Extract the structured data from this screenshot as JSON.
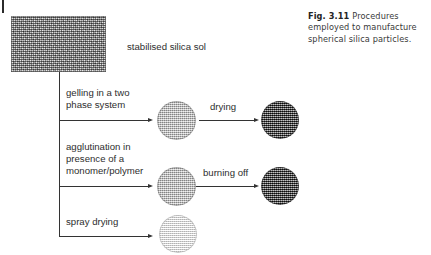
{
  "figure": {
    "caption_number": "Fig. 3.11",
    "caption_text": "Procedures employed to manufacture spherical silica particles."
  },
  "diagram": {
    "source": {
      "label": "stabilised silica sol",
      "texture_name": "silica-sol-noise-texture",
      "color": "#a9a9a9"
    },
    "branches": [
      {
        "id": "gelling",
        "label": "gelling in a two\nphase system",
        "product_texture": "light-dotted-sphere",
        "step": {
          "label": "drying",
          "product_texture": "dark-checkered-sphere"
        }
      },
      {
        "id": "agglutination",
        "label": "agglutination in\npresence of a\nmonomer/polymer",
        "product_texture": "light-dotted-sphere",
        "step": {
          "label": "burning off",
          "product_texture": "dark-checkered-sphere"
        }
      },
      {
        "id": "spray-drying",
        "label": "spray drying",
        "product_texture": "pale-grid-sphere",
        "step": null
      }
    ],
    "colors": {
      "line": "#333333",
      "text": "#2e2e2e",
      "caption_text": "#3a3a3a",
      "light_particle": "#b0b0b0",
      "dark_particle": "#4a4a4a",
      "pale_particle": "#f2f2f2"
    }
  }
}
